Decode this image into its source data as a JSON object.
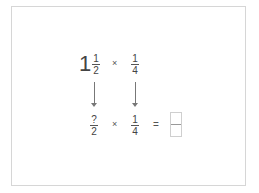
{
  "problem": {
    "top_row": {
      "mixed_number": {
        "whole": "1",
        "numerator": "1",
        "denominator": "2"
      },
      "operator": "×",
      "second_fraction": {
        "numerator": "1",
        "denominator": "4"
      }
    },
    "bottom_row": {
      "improper_fraction": {
        "numerator": "?",
        "denominator": "2"
      },
      "operator": "×",
      "second_fraction": {
        "numerator": "1",
        "denominator": "4"
      },
      "equals": "=",
      "answer": {
        "numerator": "",
        "denominator": ""
      }
    },
    "arrows": [
      "down-arrow",
      "down-arrow"
    ]
  },
  "colors": {
    "text": "#444444",
    "frame_border": "#d6d6d6",
    "box_border": "#cfcfcf"
  }
}
